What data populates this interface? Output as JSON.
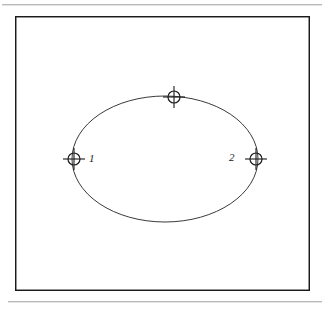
{
  "figure": {
    "kind": "engineering-line-drawing",
    "background_color": "#ffffff",
    "stroke_color": "#3a3a3a",
    "frame": {
      "name": "drawing-frame",
      "border_color": "#1a1a1a",
      "x": 15,
      "y": 16,
      "width": 295,
      "height": 275
    },
    "rules": {
      "top_label": "",
      "bottom_label": "",
      "color": "#b9b9b9"
    },
    "shape": {
      "type": "ellipse",
      "center_x": 165,
      "center_y": 159,
      "radius_x": 93,
      "radius_y": 63,
      "stroke_color": "#3a3a3a",
      "stroke_width": 1
    },
    "markers": [
      {
        "name": "vertex-marker-1",
        "symbol": "circle-cross-node-icon",
        "x": 74,
        "y": 159,
        "radius": 6,
        "tick_length": 11,
        "label": "1",
        "label_position": "right"
      },
      {
        "name": "vertex-marker-top",
        "symbol": "circle-cross-node-icon",
        "x": 174,
        "y": 97,
        "radius": 6,
        "tick_length": 11,
        "label": "",
        "label_position": "none"
      },
      {
        "name": "vertex-marker-2",
        "symbol": "circle-cross-node-icon",
        "x": 256,
        "y": 159,
        "radius": 6,
        "tick_length": 11,
        "label": "2",
        "label_position": "left"
      }
    ],
    "labels": {
      "vertex_1": "1",
      "vertex_2": "2"
    }
  }
}
